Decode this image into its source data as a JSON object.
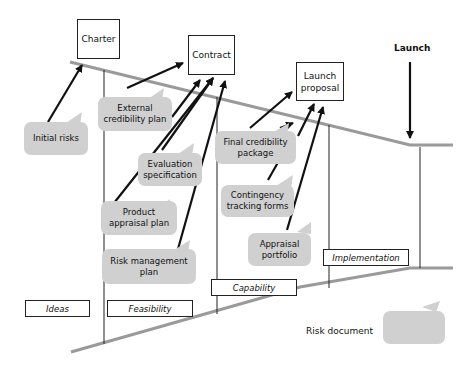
{
  "diagram": {
    "milestones": [
      {
        "id": "charter",
        "label": "Charter"
      },
      {
        "id": "contract",
        "label": "Contract"
      },
      {
        "id": "launch-proposal",
        "label": "Launch\nproposal"
      }
    ],
    "launch_label": "Launch",
    "stages": [
      {
        "id": "ideas",
        "label": "Ideas"
      },
      {
        "id": "feasibility",
        "label": "Feasibility"
      },
      {
        "id": "capability",
        "label": "Capability"
      },
      {
        "id": "implementation",
        "label": "Implementation"
      }
    ],
    "documents": [
      {
        "id": "initial-risks",
        "label": "Initial risks",
        "target": "charter"
      },
      {
        "id": "external-credibility-plan",
        "label": "External credibility plan",
        "target": "contract"
      },
      {
        "id": "evaluation-specification",
        "label": "Evaluation specification",
        "target": "contract"
      },
      {
        "id": "product-appraisal-plan",
        "label": "Product appraisal plan",
        "target": "contract"
      },
      {
        "id": "risk-management-plan",
        "label": "Risk management plan",
        "target": "contract"
      },
      {
        "id": "final-credibility-package",
        "label": "Final credibility package",
        "target": "launch-proposal"
      },
      {
        "id": "contingency-tracking-forms",
        "label": "Contingency tracking forms",
        "target": "launch-proposal"
      },
      {
        "id": "appraisal-portfolio",
        "label": "Appraisal portfolio",
        "target": "launch-proposal"
      }
    ],
    "legend": {
      "label": "Risk document"
    },
    "colors": {
      "bubble": "#d0d0d0",
      "funnel_line": "#9a9a9a",
      "arrow": "#111111"
    }
  }
}
